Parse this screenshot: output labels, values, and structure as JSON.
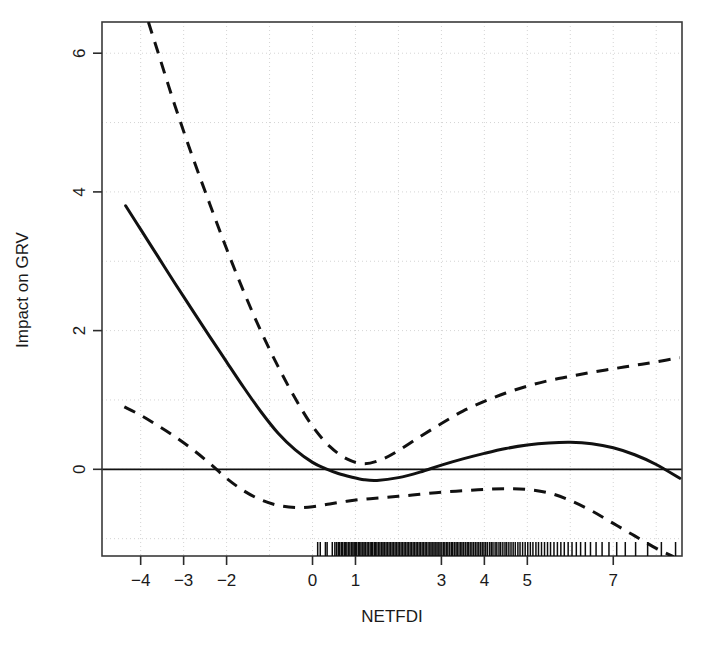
{
  "chart_data": {
    "type": "line",
    "title": "",
    "xlabel": "NETFDI",
    "ylabel": "Impact on GRV",
    "grid": true,
    "legend": null,
    "xlim": [
      -4.9,
      8.6
    ],
    "ylim": [
      -1.25,
      6.45
    ],
    "xticks": [
      -4,
      -3,
      -2,
      0,
      1,
      3,
      4,
      5,
      7
    ],
    "xtick_labels": [
      "-4",
      "-3",
      "-2",
      "0",
      "1",
      "3",
      "4",
      "5",
      "7"
    ],
    "yticks": [
      0,
      2,
      4,
      6
    ],
    "ytick_labels": [
      "0",
      "2",
      "4",
      "6"
    ],
    "series": [
      {
        "name": "fitted smooth",
        "style": "solid",
        "x": [
          -4.35,
          -4.0,
          -3.6,
          -3.2,
          -2.8,
          -2.4,
          -2.0,
          -1.6,
          -1.2,
          -0.8,
          -0.4,
          0.0,
          0.3,
          0.6,
          0.9,
          1.2,
          1.5,
          2.0,
          2.5,
          3.0,
          3.5,
          4.0,
          4.5,
          5.0,
          5.5,
          6.0,
          6.5,
          7.0,
          7.5,
          8.0,
          8.55
        ],
        "y": [
          3.8,
          3.46,
          3.07,
          2.68,
          2.3,
          1.92,
          1.55,
          1.18,
          0.83,
          0.52,
          0.28,
          0.1,
          0.01,
          -0.06,
          -0.11,
          -0.15,
          -0.16,
          -0.12,
          -0.04,
          0.06,
          0.15,
          0.23,
          0.3,
          0.35,
          0.38,
          0.39,
          0.37,
          0.31,
          0.21,
          0.07,
          -0.13
        ]
      },
      {
        "name": "upper 95% confidence band",
        "style": "dashed",
        "x": [
          -3.82,
          -3.6,
          -3.2,
          -2.8,
          -2.4,
          -2.0,
          -1.6,
          -1.2,
          -0.8,
          -0.4,
          0.0,
          0.4,
          0.8,
          1.2,
          1.6,
          2.0,
          2.5,
          3.0,
          3.5,
          4.0,
          4.5,
          5.0,
          5.5,
          6.0,
          6.5,
          7.0,
          7.5,
          8.0,
          8.55
        ],
        "y": [
          6.45,
          6.02,
          5.24,
          4.52,
          3.84,
          3.18,
          2.56,
          1.99,
          1.48,
          1.02,
          0.62,
          0.33,
          0.15,
          0.08,
          0.14,
          0.27,
          0.47,
          0.66,
          0.84,
          0.98,
          1.1,
          1.2,
          1.28,
          1.34,
          1.4,
          1.45,
          1.5,
          1.55,
          1.61
        ]
      },
      {
        "name": "lower 95% confidence band",
        "style": "dashed",
        "x": [
          -4.38,
          -4.0,
          -3.6,
          -3.2,
          -2.8,
          -2.4,
          -2.0,
          -1.6,
          -1.2,
          -0.8,
          -0.4,
          0.0,
          0.4,
          0.8,
          1.2,
          1.6,
          2.0,
          2.5,
          3.0,
          3.5,
          4.0,
          4.5,
          5.0,
          5.5,
          6.0,
          6.5,
          7.0,
          7.5,
          8.0,
          8.4
        ],
        "y": [
          0.9,
          0.78,
          0.63,
          0.47,
          0.29,
          0.09,
          -0.13,
          -0.31,
          -0.44,
          -0.52,
          -0.55,
          -0.54,
          -0.5,
          -0.46,
          -0.43,
          -0.41,
          -0.39,
          -0.36,
          -0.33,
          -0.31,
          -0.29,
          -0.28,
          -0.29,
          -0.34,
          -0.45,
          -0.6,
          -0.78,
          -0.96,
          -1.14,
          -1.26
        ]
      }
    ],
    "rug": {
      "name": "observation rug",
      "x": [
        0.12,
        0.18,
        0.3,
        0.34,
        0.46,
        0.52,
        0.56,
        0.6,
        0.63,
        0.67,
        0.7,
        0.74,
        0.77,
        0.8,
        0.84,
        0.87,
        0.91,
        0.94,
        0.97,
        1.0,
        1.03,
        1.07,
        1.1,
        1.13,
        1.17,
        1.2,
        1.23,
        1.27,
        1.3,
        1.34,
        1.37,
        1.4,
        1.44,
        1.47,
        1.5,
        1.54,
        1.57,
        1.61,
        1.64,
        1.67,
        1.71,
        1.74,
        1.78,
        1.81,
        1.85,
        1.88,
        1.92,
        1.95,
        1.99,
        2.02,
        2.06,
        2.09,
        2.13,
        2.16,
        2.2,
        2.23,
        2.27,
        2.3,
        2.34,
        2.37,
        2.41,
        2.44,
        2.48,
        2.51,
        2.55,
        2.58,
        2.62,
        2.65,
        2.69,
        2.73,
        2.76,
        2.8,
        2.83,
        2.87,
        2.9,
        2.94,
        2.97,
        3.01,
        3.05,
        3.08,
        3.12,
        3.15,
        3.19,
        3.23,
        3.26,
        3.3,
        3.34,
        3.37,
        3.41,
        3.45,
        3.48,
        3.52,
        3.56,
        3.6,
        3.63,
        3.67,
        3.71,
        3.75,
        3.79,
        3.83,
        3.87,
        3.91,
        3.95,
        3.99,
        4.03,
        4.07,
        4.12,
        4.16,
        4.2,
        4.25,
        4.29,
        4.34,
        4.38,
        4.43,
        4.48,
        4.52,
        4.57,
        4.62,
        4.67,
        4.72,
        4.78,
        4.83,
        4.89,
        4.95,
        5.01,
        5.07,
        5.13,
        5.2,
        5.26,
        5.33,
        5.4,
        5.47,
        5.54,
        5.62,
        5.7,
        5.78,
        5.86,
        5.95,
        6.04,
        6.14,
        6.24,
        6.35,
        6.47,
        6.6,
        6.74,
        6.9,
        7.08,
        7.28,
        7.52,
        7.8,
        8.12,
        8.45
      ]
    }
  },
  "axes": {
    "x_axis_title": "NETFDI",
    "y_axis_title": "Impact on GRV"
  }
}
